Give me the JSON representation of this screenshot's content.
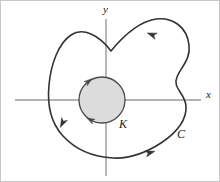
{
  "figure": {
    "width": 220,
    "height": 182,
    "background_color": "#ffffff",
    "border_color": "#c8c8c8"
  },
  "axes": {
    "color": "#9a9a9a",
    "stroke_width": 1.4,
    "origin": {
      "x": 105,
      "y": 99
    },
    "x_axis": {
      "label": "x",
      "label_x": 205,
      "label_y": 97,
      "x_start": 14,
      "x_end": 200,
      "y": 99
    },
    "y_axis": {
      "label": "y",
      "label_x": 102,
      "label_y": 12,
      "y_start": 18,
      "y_end": 175,
      "x": 105
    }
  },
  "inner_circle": {
    "name": "K",
    "label": "K",
    "label_x": 118,
    "label_y": 127,
    "center_x": 101,
    "center_y": 99,
    "radius": 23,
    "fill_color": "#dcdcdc",
    "stroke_color": "#4a4a4a",
    "stroke_width": 1.3,
    "orientation": "clockwise",
    "arrowheads": [
      {
        "angle_deg": 128,
        "direction": "tangent-clockwise"
      },
      {
        "angle_deg": 242,
        "direction": "tangent-clockwise"
      }
    ]
  },
  "outer_curve": {
    "name": "C",
    "label": "C",
    "label_x": 176,
    "label_y": 137,
    "stroke_color": "#333333",
    "stroke_width": 1.6,
    "orientation": "counterclockwise",
    "path": "M 110 50 C 128 28 142 20 155 18 C 172 16 186 26 188 44 C 190 58 180 66 176 76 C 171 87 184 92 185 105 C 186 122 172 134 160 142 C 146 151 128 158 112 157 C 92 156 74 148 62 135 C 50 122 46 104 48 84 C 50 62 58 42 70 34 C 82 26 98 34 110 50 Z",
    "arrowheads": [
      {
        "x": 152,
        "y": 34,
        "angle_deg": 200,
        "note": "top lobe, pointing left"
      },
      {
        "x": 62,
        "y": 121,
        "angle_deg": 116,
        "note": "lower-left, pointing down-left"
      },
      {
        "x": 148,
        "y": 152,
        "angle_deg": 344,
        "note": "bottom, pointing right"
      }
    ]
  }
}
